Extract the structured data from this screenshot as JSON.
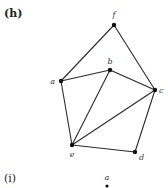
{
  "panels": [
    {
      "id": "h",
      "label": "(h)",
      "vertices": [
        {
          "name": "f",
          "label": "f"
        },
        {
          "name": "a",
          "label": "a"
        },
        {
          "name": "b",
          "label": "b"
        },
        {
          "name": "c",
          "label": "c"
        },
        {
          "name": "e",
          "label": "e"
        },
        {
          "name": "d",
          "label": "d"
        }
      ],
      "edges": [
        [
          "f",
          "a"
        ],
        [
          "f",
          "c"
        ],
        [
          "a",
          "b"
        ],
        [
          "b",
          "c"
        ],
        [
          "a",
          "e"
        ],
        [
          "b",
          "e"
        ],
        [
          "c",
          "e"
        ],
        [
          "e",
          "d"
        ],
        [
          "c",
          "d"
        ]
      ]
    },
    {
      "id": "i",
      "label": "(i)",
      "vertices": [
        {
          "name": "a",
          "label": "a"
        }
      ],
      "edges": []
    }
  ],
  "colors": {
    "edge": "#2a2a2a",
    "vertex": "#111111",
    "text": "#222222"
  }
}
